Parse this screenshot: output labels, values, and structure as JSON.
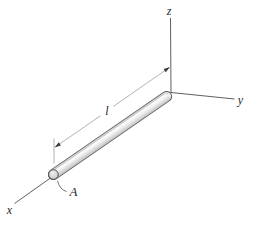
{
  "figure": {
    "labels": {
      "z_axis": "z",
      "y_axis": "y",
      "x_axis": "x",
      "rod_length": "l",
      "cross_section_area": "A"
    },
    "colors": {
      "background": "#ffffff",
      "axis_line": "#4d4d4d",
      "dimension_line": "#9a9a9a",
      "arrowhead": "#3a3a3a",
      "rod_outline": "#4f4f4f",
      "rod_body": "#d9d9d9",
      "rod_highlight": "#fafafa",
      "rod_shading_line": "#9e9e9e",
      "end_cap_fill": "#cfcfcf",
      "label_text": "#1f1f1f"
    }
  }
}
